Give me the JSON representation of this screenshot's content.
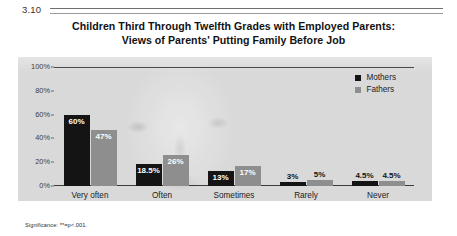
{
  "figure": {
    "number": "3.10",
    "title_line_1": "Children Third Through Twelfth Grades with Employed Parents:",
    "title_line_2": "Views of Parents' Putting Family Before Job",
    "significance_note": "Significance: **=p<.001."
  },
  "chart_data": {
    "type": "bar",
    "title": "Children Third Through Twelfth Grades with Employed Parents: Views of Parents' Putting Family Before Job",
    "xlabel": "",
    "ylabel": "",
    "ylim": [
      0,
      100
    ],
    "yticks": [
      "0%",
      "20%",
      "40%",
      "60%",
      "80%",
      "100%"
    ],
    "ytick_values": [
      0,
      20,
      40,
      60,
      80,
      100
    ],
    "grid": false,
    "legend_position": "top-right",
    "categories": [
      "Very often",
      "Often",
      "Sometimes",
      "Rarely",
      "Never"
    ],
    "series": [
      {
        "name": "Mothers",
        "color": "#141414",
        "values": [
          60,
          18.5,
          13,
          3,
          4.5
        ],
        "labels": [
          "60%",
          "18.5%",
          "13%",
          "3%",
          "4.5%"
        ]
      },
      {
        "name": "Fathers",
        "color": "#8e8e8e",
        "values": [
          47,
          26,
          17,
          5,
          4.5
        ],
        "labels": [
          "47%",
          "26%",
          "17%",
          "5%",
          "4.5%"
        ]
      }
    ]
  }
}
